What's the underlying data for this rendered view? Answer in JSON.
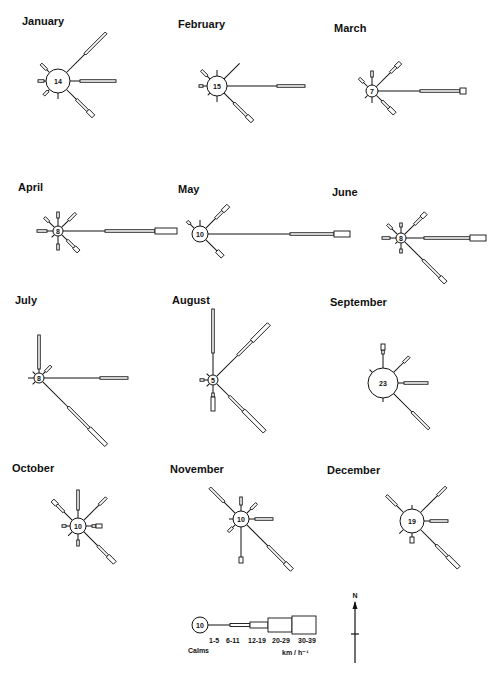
{
  "figure": {
    "speed_unit": "km / h⁻¹",
    "north_label": "N"
  },
  "legend": {
    "calm_value": "10",
    "calm_label": "Calms",
    "classes": [
      "1-5",
      "6-11",
      "12-19",
      "20-29",
      "30-39"
    ],
    "unit": "km / h⁻¹",
    "segment_lengths": [
      22,
      20,
      18,
      24,
      24
    ],
    "segment_widths": [
      1,
      3,
      6,
      14,
      18
    ]
  },
  "chart_data": {
    "type": "wind_rose",
    "directions": [
      "N",
      "NE",
      "E",
      "SE",
      "S",
      "SW",
      "W",
      "NW"
    ],
    "speed_classes": [
      "1-5",
      "6-11",
      "12-19",
      "20-29",
      "30-39"
    ],
    "note": "Arm values are approximate segment lengths (px) per speed class, read from the figure",
    "months": [
      {
        "name": "January",
        "calms": 14,
        "cx": 58,
        "cy": 81,
        "r": 12,
        "arms": {
          "NE": [
            26,
            30,
            0,
            0,
            0
          ],
          "E": [
            10,
            36,
            0,
            0,
            0
          ],
          "SE": [
            14,
            16,
            8,
            0,
            0
          ],
          "NW": [
            4,
            8,
            0,
            0,
            0
          ],
          "W": [
            2,
            6,
            0,
            0,
            0
          ],
          "SW": [
            2,
            6,
            0,
            0,
            0
          ],
          "S": [
            6,
            0,
            0,
            0,
            0
          ]
        }
      },
      {
        "name": "February",
        "calms": 15,
        "cx": 217,
        "cy": 86,
        "r": 10,
        "arms": {
          "NE": [
            22,
            0,
            0,
            0,
            0
          ],
          "E": [
            50,
            28,
            0,
            0,
            0
          ],
          "SE": [
            14,
            18,
            8,
            0,
            0
          ],
          "NW": [
            4,
            8,
            0,
            0,
            0
          ],
          "W": [
            4,
            4,
            0,
            0,
            0
          ],
          "N": [
            6,
            0,
            0,
            0,
            0
          ],
          "S": [
            6,
            0,
            0,
            0,
            0
          ],
          "SW": [
            3,
            0,
            0,
            0,
            0
          ]
        }
      },
      {
        "name": "March",
        "calms": 7,
        "cx": 372,
        "cy": 91,
        "r": 6,
        "arms": {
          "NE": [
            20,
            8,
            6,
            0,
            0
          ],
          "E": [
            42,
            40,
            0,
            6,
            0
          ],
          "SE": [
            8,
            10,
            8,
            0,
            0
          ],
          "NW": [
            6,
            6,
            0,
            0,
            0
          ],
          "N": [
            8,
            6,
            0,
            0,
            0
          ],
          "S": [
            6,
            0,
            0,
            0,
            0
          ],
          "SW": [
            4,
            0,
            0,
            0,
            0
          ]
        }
      },
      {
        "name": "April",
        "calms": 8,
        "cx": 58,
        "cy": 231,
        "r": 5,
        "arms": {
          "E": [
            42,
            50,
            0,
            22,
            0
          ],
          "NE": [
            10,
            10,
            0,
            0,
            0
          ],
          "SE": [
            8,
            10,
            6,
            0,
            0
          ],
          "W": [
            6,
            10,
            0,
            0,
            0
          ],
          "NW": [
            8,
            6,
            0,
            0,
            0
          ],
          "N": [
            8,
            6,
            0,
            0,
            0
          ],
          "S": [
            8,
            6,
            0,
            0,
            0
          ],
          "SW": [
            4,
            0,
            0,
            0,
            0
          ]
        }
      },
      {
        "name": "May",
        "calms": 10,
        "cx": 200,
        "cy": 234,
        "r": 8,
        "arms": {
          "E": [
            82,
            44,
            0,
            16,
            0
          ],
          "NE": [
            14,
            10,
            8,
            0,
            0
          ],
          "SE": [
            16,
            0,
            8,
            0,
            0
          ],
          "NW": [
            6,
            4,
            0,
            0,
            0
          ],
          "N": [
            6,
            0,
            0,
            0,
            0
          ]
        }
      },
      {
        "name": "June",
        "calms": 8,
        "cx": 401,
        "cy": 238,
        "r": 5,
        "arms": {
          "E": [
            18,
            46,
            0,
            16,
            0
          ],
          "SE": [
            26,
            24,
            8,
            0,
            0
          ],
          "NE": [
            14,
            10,
            6,
            0,
            0
          ],
          "W": [
            6,
            8,
            0,
            0,
            0
          ],
          "NW": [
            8,
            6,
            0,
            0,
            0
          ],
          "N": [
            6,
            4,
            0,
            0,
            0
          ],
          "S": [
            6,
            4,
            0,
            0,
            0
          ],
          "SW": [
            3,
            0,
            0,
            0,
            0
          ]
        }
      },
      {
        "name": "July",
        "calms": 8,
        "cx": 39,
        "cy": 378,
        "r": 5,
        "arms": {
          "E": [
            56,
            28,
            0,
            0,
            0
          ],
          "SE": [
            36,
            30,
            24,
            0,
            0
          ],
          "N": [
            4,
            34,
            0,
            0,
            0
          ],
          "NE": [
            4,
            8,
            0,
            0,
            0
          ],
          "W": [
            6,
            0,
            0,
            0,
            0
          ],
          "NW": [
            4,
            0,
            0,
            0,
            0
          ],
          "SW": [
            4,
            0,
            0,
            0,
            0
          ]
        }
      },
      {
        "name": "August",
        "calms": 5,
        "cx": 213,
        "cy": 380,
        "r": 5,
        "arms": {
          "N": [
            22,
            44,
            0,
            0,
            0
          ],
          "NE": [
            30,
            20,
            24,
            0,
            0
          ],
          "SE": [
            18,
            20,
            30,
            0,
            0
          ],
          "S": [
            8,
            4,
            14,
            0,
            0
          ],
          "W": [
            4,
            4,
            0,
            0,
            0
          ],
          "NW": [
            4,
            0,
            0,
            0,
            0
          ],
          "SW": [
            4,
            0,
            0,
            0,
            0
          ]
        }
      },
      {
        "name": "September",
        "calms": 23,
        "cx": 383,
        "cy": 383,
        "r": 15,
        "arms": {
          "N": [
            14,
            4,
            6,
            0,
            0
          ],
          "NE": [
            14,
            8,
            0,
            0,
            0
          ],
          "E": [
            6,
            24,
            0,
            0,
            0
          ],
          "SE": [
            26,
            24,
            0,
            0,
            0
          ],
          "NW": [
            4,
            0,
            0,
            0,
            0
          ],
          "S": [
            4,
            0,
            0,
            0,
            0
          ]
        }
      },
      {
        "name": "October",
        "calms": 10,
        "cx": 78,
        "cy": 526,
        "r": 8,
        "arms": {
          "NE": [
            22,
            10,
            0,
            0,
            0
          ],
          "N": [
            8,
            20,
            0,
            0,
            0
          ],
          "NW": [
            12,
            10,
            6,
            0,
            0
          ],
          "E": [
            6,
            4,
            6,
            0,
            0
          ],
          "W": [
            4,
            4,
            0,
            0,
            0
          ],
          "S": [
            6,
            6,
            0,
            0,
            0
          ],
          "SE": [
            20,
            14,
            10,
            0,
            0
          ],
          "SW": [
            6,
            0,
            0,
            0,
            0
          ]
        }
      },
      {
        "name": "November",
        "calms": 10,
        "cx": 241,
        "cy": 519,
        "r": 8,
        "arms": {
          "NW": [
            16,
            20,
            0,
            0,
            0
          ],
          "N": [
            6,
            8,
            0,
            0,
            0
          ],
          "NE": [
            6,
            8,
            0,
            0,
            0
          ],
          "E": [
            6,
            18,
            0,
            0,
            0
          ],
          "SE": [
            30,
            24,
            10,
            0,
            0
          ],
          "S": [
            30,
            0,
            6,
            0,
            0
          ],
          "SW": [
            4,
            6,
            0,
            0,
            0
          ],
          "W": [
            4,
            0,
            0,
            0,
            0
          ]
        }
      },
      {
        "name": "December",
        "calms": 19,
        "cx": 412,
        "cy": 521,
        "r": 12,
        "arms": {
          "NW": [
            10,
            14,
            0,
            0,
            0
          ],
          "NE": [
            24,
            12,
            0,
            0,
            0
          ],
          "E": [
            6,
            18,
            0,
            0,
            0
          ],
          "SE": [
            22,
            16,
            16,
            0,
            0
          ],
          "N": [
            4,
            0,
            0,
            0,
            0
          ],
          "SW": [
            6,
            0,
            0,
            0,
            0
          ],
          "S": [
            4,
            0,
            6,
            0,
            0
          ]
        }
      }
    ]
  }
}
